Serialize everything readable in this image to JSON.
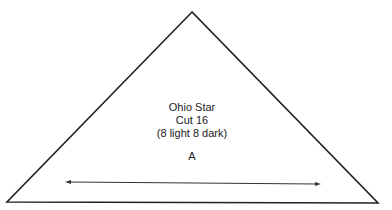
{
  "pattern": {
    "title": "Ohio Star",
    "cut": "Cut 16",
    "note": "(8 light 8 dark)",
    "piece_label": "A"
  },
  "shape": {
    "type": "triangle",
    "stroke_color": "#222222",
    "grain_arrow": "double-headed horizontal arrow"
  }
}
